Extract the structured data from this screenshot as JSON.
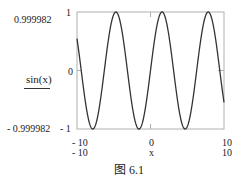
{
  "chart_data": {
    "type": "line",
    "title": "",
    "function": "sin(x)",
    "xlabel": "x",
    "ylabel": "sin(x)",
    "xlim": [
      -10,
      10
    ],
    "ylim": [
      -1,
      1
    ],
    "x_ticks": [
      "-10",
      "0",
      "10"
    ],
    "y_ticks": [
      "1",
      "0",
      "-1"
    ],
    "y_range_labels": {
      "max": "0.999982",
      "min": "-0.999982"
    },
    "x_range_labels": {
      "min": "-10",
      "max": "10"
    },
    "series": [
      {
        "name": "sin(x)",
        "color": "#333333",
        "samples": 400
      }
    ],
    "grid": false
  },
  "labels": {
    "ymax_range": "0.999982",
    "ymin_range": "- 0.999982",
    "ytick_top": "1",
    "ytick_mid": "0",
    "ytick_bottom": "- 1",
    "ylabel": "sin(x)",
    "xtick_left": "- 10",
    "xtick_mid": "0",
    "xtick_right": "10",
    "xrange_left": "- 10",
    "xrange_right": "10",
    "xlabel": "x"
  },
  "caption": "图 6.1"
}
